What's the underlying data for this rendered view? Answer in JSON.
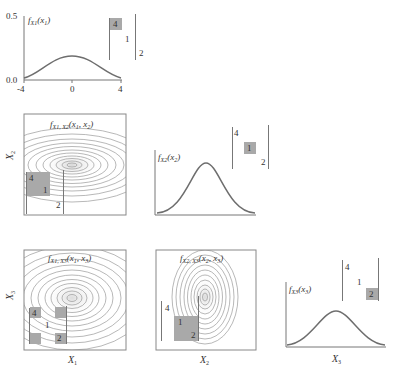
{
  "figure": {
    "panels": {
      "f_x1": {
        "func_label": "f",
        "func_sub": "X1",
        "func_arg": "(x",
        "func_arg_sub": "1",
        "func_close": ")",
        "y_ticks": [
          "0.5",
          "0.0"
        ],
        "x_ticks": [
          "-4",
          "0",
          "4"
        ],
        "matrix": {
          "a": "4",
          "b": "1",
          "c": "2",
          "highlight": "4"
        }
      },
      "f_x1x2": {
        "func_label": "f",
        "func_sub": "X1, X2",
        "func_arg": "(x",
        "func_arg_sub1": "1",
        "func_mid": ", x",
        "func_arg_sub2": "2",
        "func_close": ")",
        "y_axis_label": "X",
        "y_axis_sub": "2",
        "matrix": {
          "a": "4",
          "b": "1",
          "c": "2",
          "highlight": "4-1 block"
        }
      },
      "f_x2": {
        "func_label": "f",
        "func_sub": "X2",
        "func_arg": "(x",
        "func_arg_sub": "2",
        "func_close": ")",
        "matrix": {
          "a": "4",
          "b": "1",
          "c": "2",
          "highlight": "1"
        }
      },
      "f_x1x3": {
        "func_label": "f",
        "func_sub": "X1, X3",
        "func_arg": "(x",
        "func_arg_sub1": "1",
        "func_mid": ", x",
        "func_arg_sub2": "3",
        "func_close": ")",
        "y_axis_label": "X",
        "y_axis_sub": "3",
        "x_axis_label": "X",
        "x_axis_sub": "1",
        "matrix": {
          "a": "4",
          "b": "1",
          "c": "2",
          "highlight": "corners 4 and 2"
        }
      },
      "f_x2x3": {
        "func_label": "f",
        "func_sub": "X2, X3",
        "func_arg": "(x",
        "func_arg_sub1": "2",
        "func_mid": ", x",
        "func_arg_sub2": "3",
        "func_close": ")",
        "x_axis_label": "X",
        "x_axis_sub": "2",
        "matrix": {
          "a": "4",
          "b": "1",
          "c": "2",
          "highlight": "1-2 block"
        }
      },
      "f_x3": {
        "func_label": "f",
        "func_sub": "X3",
        "func_arg": "(x",
        "func_arg_sub": "3",
        "func_close": ")",
        "x_axis_label": "X",
        "x_axis_sub": "3",
        "matrix": {
          "a": "4",
          "b": "1",
          "c": "2",
          "highlight": "2"
        }
      }
    },
    "colors": {
      "curve": "#6e6e6e",
      "contour": "#9a9a9a",
      "highlight": "#a9a9a9",
      "frame": "#888888"
    }
  }
}
